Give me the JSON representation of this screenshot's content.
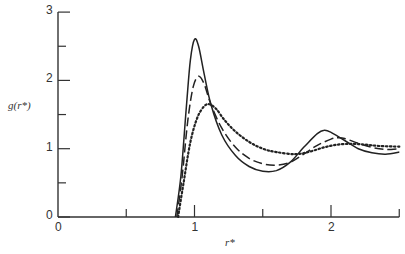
{
  "chart_data": {
    "type": "line",
    "title": "",
    "xlabel": "r*",
    "ylabel": "g(r*)",
    "xlim": [
      0,
      2.5
    ],
    "ylim": [
      0,
      3
    ],
    "grid": false,
    "legend": "none",
    "x_ticks": [
      0,
      0.5,
      1,
      1.5,
      2,
      2.5
    ],
    "x_tick_labels": [
      "0",
      "",
      "1",
      "",
      "2",
      ""
    ],
    "y_ticks": [
      0,
      0.5,
      1,
      1.5,
      2,
      2.5,
      3
    ],
    "y_tick_labels": [
      "0",
      "",
      "1",
      "",
      "2",
      "",
      "3"
    ],
    "series": [
      {
        "name": "solid",
        "style": "solid",
        "points": [
          [
            0.86,
            0
          ],
          [
            0.9,
            0.6
          ],
          [
            0.94,
            1.6
          ],
          [
            0.97,
            2.3
          ],
          [
            1.0,
            2.6
          ],
          [
            1.03,
            2.5
          ],
          [
            1.07,
            2.1
          ],
          [
            1.12,
            1.65
          ],
          [
            1.2,
            1.2
          ],
          [
            1.3,
            0.9
          ],
          [
            1.4,
            0.74
          ],
          [
            1.5,
            0.67
          ],
          [
            1.6,
            0.68
          ],
          [
            1.7,
            0.8
          ],
          [
            1.8,
            1.02
          ],
          [
            1.9,
            1.22
          ],
          [
            1.95,
            1.27
          ],
          [
            2.0,
            1.24
          ],
          [
            2.1,
            1.12
          ],
          [
            2.2,
            1.0
          ],
          [
            2.3,
            0.94
          ],
          [
            2.4,
            0.92
          ],
          [
            2.5,
            0.95
          ]
        ]
      },
      {
        "name": "dashed",
        "style": "dashed",
        "points": [
          [
            0.87,
            0
          ],
          [
            0.91,
            0.6
          ],
          [
            0.95,
            1.4
          ],
          [
            0.99,
            1.9
          ],
          [
            1.03,
            2.06
          ],
          [
            1.07,
            1.95
          ],
          [
            1.12,
            1.65
          ],
          [
            1.2,
            1.3
          ],
          [
            1.3,
            1.02
          ],
          [
            1.4,
            0.86
          ],
          [
            1.5,
            0.78
          ],
          [
            1.6,
            0.76
          ],
          [
            1.7,
            0.8
          ],
          [
            1.8,
            0.92
          ],
          [
            1.9,
            1.05
          ],
          [
            2.0,
            1.14
          ],
          [
            2.05,
            1.16
          ],
          [
            2.1,
            1.15
          ],
          [
            2.2,
            1.08
          ],
          [
            2.3,
            1.02
          ],
          [
            2.4,
            0.99
          ],
          [
            2.5,
            1.0
          ]
        ]
      },
      {
        "name": "dotted",
        "style": "dotted",
        "points": [
          [
            0.88,
            0
          ],
          [
            0.92,
            0.5
          ],
          [
            0.97,
            1.1
          ],
          [
            1.02,
            1.45
          ],
          [
            1.07,
            1.62
          ],
          [
            1.11,
            1.65
          ],
          [
            1.16,
            1.58
          ],
          [
            1.22,
            1.42
          ],
          [
            1.3,
            1.25
          ],
          [
            1.4,
            1.1
          ],
          [
            1.5,
            1.0
          ],
          [
            1.6,
            0.95
          ],
          [
            1.74,
            0.92
          ],
          [
            1.85,
            0.96
          ],
          [
            1.95,
            1.02
          ],
          [
            2.05,
            1.06
          ],
          [
            2.15,
            1.07
          ],
          [
            2.25,
            1.06
          ],
          [
            2.35,
            1.04
          ],
          [
            2.5,
            1.03
          ]
        ]
      }
    ]
  }
}
